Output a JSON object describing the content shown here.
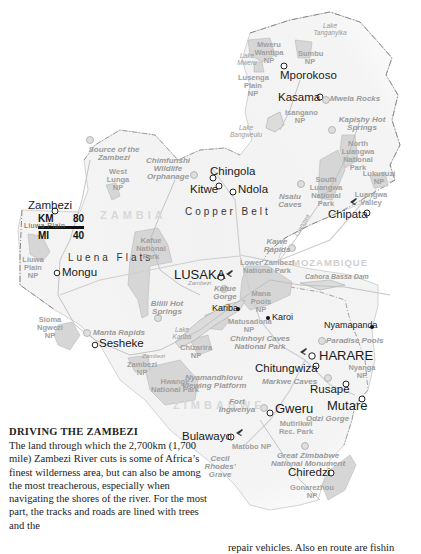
{
  "scale_bar": {
    "km_label": "KM",
    "km_value": "80",
    "mi_label": "MI",
    "mi_value": "40"
  },
  "countries": {
    "zambia": "ZAMBIA",
    "zimbabwe": "ZIMBABWE",
    "mozambique": "MOZAMBIQUE"
  },
  "regions": {
    "copper_belt": "Copper Belt",
    "luena_flats": "Luena Flats",
    "liuwa_plain": "Liuwa Plain"
  },
  "cities": {
    "mporokoso": "Mporokoso",
    "kasama": "Kasama",
    "chingola": "Chingola",
    "kitwe": "Kitwe",
    "ndola": "Ndola",
    "zambezi": "Zambezi",
    "mongu": "Mongu",
    "lusaka": "LUSAKA",
    "chipata": "Chipata",
    "sesheke": "Sesheke",
    "kariba": "Kariba",
    "karoi": "Karoi",
    "nyamapanda": "Nyamapanda",
    "harare": "HARARE",
    "chitungwiza": "Chitungwiza",
    "rusape": "Rusape",
    "mutare": "Mutare",
    "gweru": "Gweru",
    "bulawayo": "Bulawayo",
    "chiredzi": "Chiredzi"
  },
  "poi": {
    "source_zambezi": "Source of the Zambezi",
    "chimfunshi": "Chimfunshi Wildlife Orphanage",
    "mwela_rocks": "Mwela Rocks",
    "kapishya": "Kapishy Hot Springs",
    "nsalu_caves": "Nsalu Caves",
    "kawe_rapids": "Kawe Rapids",
    "kafue_gorge": "Kafue Gorge",
    "bilili": "Bilili Hot Springs",
    "manta_rapids": "Manta Rapids",
    "cahora_bassa": "Cahora Bassa Dam",
    "chinhoyi": "Chinhoyi Caves National Park",
    "paradise_pools": "Paradise Pools",
    "nyamandhlovu": "Nyamandhlovu Viewing Platform",
    "markwe": "Markwe Caves",
    "fort_ingwenya": "Fort Ingwenya",
    "odzi": "Odzi Gorge",
    "great_zimbabwe": "Great Zimbabwe National Monument",
    "cecil_rhodes": "Cecil Rhodes' Grave"
  },
  "parks": {
    "mweru": "Mweru Wantipa NP",
    "sumbu": "Sumbu NP",
    "lusenga": "Lusenga Plain NP",
    "isangano": "Isangano NP",
    "north_luangwa": "North Luangwa National Park",
    "lukusuzi": "Lukusuzi NP",
    "south_luangwa": "South Luangwa National Park",
    "luangwa_valley": "Luangwa Valley",
    "west_lunga": "West Lunga NP",
    "kafue": "Kafue National Park",
    "liuwa": "Liuwa Plain NP",
    "sioma": "Sioma Ngwezi NP",
    "lower_zambezi": "Lower Zambezi National Park",
    "mana_pools": "Mana Pools NP",
    "matusadona": "Matusadona NP",
    "chizarira": "Chizarira NP",
    "zambezi_np": "Zambezi NP",
    "hwange": "Hwange National Park",
    "nyanga": "Nyanga NP",
    "mutirikwi": "Mutirikwi Rec. Park",
    "matobo": "Matobo NP",
    "gonarezhou": "Gonarezhou NP"
  },
  "lakes": {
    "tanganyika": "Lake Tanganyika",
    "mweru": "Lake Mweru",
    "bangweulu": "Lake Bangweulu",
    "kariba": "Lake Kariba"
  },
  "rivers": {
    "zambezi": "Zambezi",
    "luangwa": "Luangwa",
    "zambezi_upper": "Zambezi"
  },
  "article": {
    "heading": "DRIVING THE ZAMBEZI",
    "body": "The land through which the 2,700km (1,700 mile) Zambezi River cuts is some of Africa’s finest wilderness area, but can also be among the most treacherous, especially when navigating the shores of the river. For the most part, the tracks and roads are lined with trees and the",
    "column2_fragment": "repair vehicles. Also en route are fishin"
  }
}
